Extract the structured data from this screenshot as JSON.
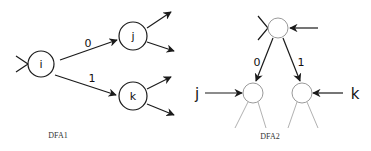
{
  "colors": {
    "background": "#ffffff",
    "stroke_dark": "#1a1a1a",
    "stroke_light": "#9a9a9a",
    "text": "#111111"
  },
  "dfa1": {
    "caption": "DFA1",
    "states": [
      {
        "id": "i",
        "label": "i"
      },
      {
        "id": "j",
        "label": "j"
      },
      {
        "id": "k",
        "label": "k"
      }
    ],
    "edges": [
      {
        "from": "i",
        "to": "j",
        "label": "0"
      },
      {
        "from": "i",
        "to": "k",
        "label": "1"
      }
    ]
  },
  "dfa2": {
    "caption": "DFA2",
    "states": [
      {
        "id": "root",
        "label": ""
      },
      {
        "id": "left",
        "label": ""
      },
      {
        "id": "right",
        "label": ""
      }
    ],
    "edges": [
      {
        "from": "root",
        "to": "left",
        "label": "0"
      },
      {
        "from": "root",
        "to": "right",
        "label": "1"
      }
    ],
    "external_inputs": [
      {
        "to": "left",
        "label": "j"
      },
      {
        "to": "right",
        "label": "k"
      }
    ]
  }
}
